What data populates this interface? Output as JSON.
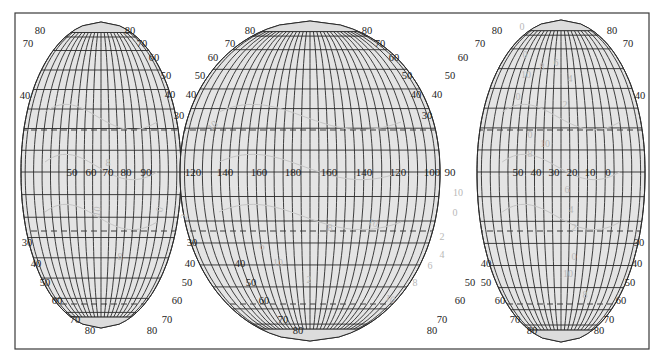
{
  "map": {
    "projection": "interrupted",
    "colors": {
      "background": "#ffffff",
      "frame": "#3a3a3a",
      "land_fill": "#e4e4e4",
      "polar_cap_fill": "#dcdcdc",
      "grid_line": "#2a2a2a",
      "dashed_line": "#3a3a3a",
      "contour_line": "#c4c4c4",
      "contour_label": "#b8b8b8",
      "label_text": "#222222"
    },
    "frame": {
      "x": 15,
      "y": 13,
      "width": 634,
      "height": 336
    },
    "equator_y": 172,
    "lobes": [
      {
        "name": "left-lobe",
        "center_x": 101,
        "half_width_at_equator": 80,
        "top_y": 22,
        "bottom_y": 328,
        "north_cut_x_left": 15,
        "north_cut_y": 82,
        "equator_labels": [
          "50",
          "60",
          "70",
          "80",
          "90"
        ],
        "equator_label_x": [
          72,
          91,
          108,
          126,
          146
        ],
        "lat_labels_left": [
          {
            "text": "80",
            "x": 40,
            "y": 34
          },
          {
            "text": "70",
            "x": 28,
            "y": 47
          },
          {
            "text": "40",
            "x": 25,
            "y": 99
          },
          {
            "text": "30",
            "x": 27,
            "y": 246
          },
          {
            "text": "40",
            "x": 36,
            "y": 267
          },
          {
            "text": "50",
            "x": 45,
            "y": 286
          },
          {
            "text": "60",
            "x": 57,
            "y": 304
          },
          {
            "text": "70",
            "x": 75,
            "y": 323
          },
          {
            "text": "80",
            "x": 90,
            "y": 334
          }
        ],
        "lat_labels_right": [
          {
            "text": "80",
            "x": 130,
            "y": 34
          },
          {
            "text": "70",
            "x": 142,
            "y": 47
          },
          {
            "text": "60",
            "x": 154,
            "y": 61
          },
          {
            "text": "50",
            "x": 166,
            "y": 79
          },
          {
            "text": "40",
            "x": 170,
            "y": 98
          },
          {
            "text": "30",
            "x": 179,
            "y": 119
          },
          {
            "text": "30",
            "x": 192,
            "y": 246
          },
          {
            "text": "40",
            "x": 190,
            "y": 267
          },
          {
            "text": "50",
            "x": 187,
            "y": 286
          },
          {
            "text": "60",
            "x": 177,
            "y": 304
          },
          {
            "text": "70",
            "x": 167,
            "y": 323
          },
          {
            "text": "80",
            "x": 152,
            "y": 334
          }
        ]
      },
      {
        "name": "center-lobe",
        "center_x": 310,
        "half_width_at_equator": 130,
        "top_y": 21,
        "bottom_y": 341,
        "equator_labels": [
          "120",
          "140",
          "160",
          "180",
          "160",
          "140",
          "120",
          "100"
        ],
        "equator_label_x": [
          193,
          225,
          259,
          293,
          329,
          364,
          398,
          432
        ],
        "lat_labels_left": [
          {
            "text": "80",
            "x": 250,
            "y": 34
          },
          {
            "text": "70",
            "x": 230,
            "y": 47
          },
          {
            "text": "60",
            "x": 213,
            "y": 61
          },
          {
            "text": "50",
            "x": 200,
            "y": 79
          },
          {
            "text": "40",
            "x": 191,
            "y": 98
          },
          {
            "text": "40",
            "x": 240,
            "y": 267
          },
          {
            "text": "50",
            "x": 251,
            "y": 286
          },
          {
            "text": "60",
            "x": 264,
            "y": 304
          },
          {
            "text": "70",
            "x": 283,
            "y": 323
          },
          {
            "text": "80",
            "x": 298,
            "y": 334
          }
        ],
        "lat_labels_right": [
          {
            "text": "80",
            "x": 367,
            "y": 34
          },
          {
            "text": "70",
            "x": 380,
            "y": 47
          },
          {
            "text": "60",
            "x": 394,
            "y": 61
          },
          {
            "text": "50",
            "x": 407,
            "y": 79
          },
          {
            "text": "40",
            "x": 416,
            "y": 98
          },
          {
            "text": "30",
            "x": 427,
            "y": 119
          },
          {
            "text": "40",
            "x": 486,
            "y": 267
          },
          {
            "text": "50",
            "x": 470,
            "y": 286
          },
          {
            "text": "60",
            "x": 460,
            "y": 304
          },
          {
            "text": "70",
            "x": 442,
            "y": 323
          },
          {
            "text": "80",
            "x": 432,
            "y": 334
          }
        ]
      },
      {
        "name": "right-lobe",
        "center_x": 561,
        "half_width_at_equator": 84,
        "top_y": 20,
        "bottom_y": 342,
        "north_cut_x_right": 649,
        "north_cut_y": 78,
        "equator_labels": [
          "50",
          "40",
          "30",
          "20",
          "10",
          "0"
        ],
        "equator_label_x": [
          518,
          536,
          554,
          572,
          590,
          608
        ],
        "extra_equator_labels": [
          {
            "text": "90",
            "x": 450
          }
        ],
        "lat_labels_left": [
          {
            "text": "80",
            "x": 497,
            "y": 34
          },
          {
            "text": "70",
            "x": 480,
            "y": 47
          },
          {
            "text": "60",
            "x": 463,
            "y": 61
          },
          {
            "text": "50",
            "x": 450,
            "y": 79
          },
          {
            "text": "40",
            "x": 437,
            "y": 98
          },
          {
            "text": "50",
            "x": 486,
            "y": 286
          },
          {
            "text": "60",
            "x": 500,
            "y": 304
          },
          {
            "text": "70",
            "x": 515,
            "y": 323
          },
          {
            "text": "80",
            "x": 532,
            "y": 334
          }
        ],
        "lat_labels_right": [
          {
            "text": "80",
            "x": 612,
            "y": 34
          },
          {
            "text": "70",
            "x": 628,
            "y": 47
          },
          {
            "text": "40",
            "x": 640,
            "y": 99
          },
          {
            "text": "30",
            "x": 639,
            "y": 246
          },
          {
            "text": "40",
            "x": 637,
            "y": 267
          },
          {
            "text": "50",
            "x": 630,
            "y": 286
          },
          {
            "text": "60",
            "x": 621,
            "y": 304
          },
          {
            "text": "70",
            "x": 609,
            "y": 323
          },
          {
            "text": "80",
            "x": 599,
            "y": 334
          }
        ]
      }
    ],
    "dashed_lines_y": [
      130,
      231,
      304
    ],
    "contour_labels": [
      {
        "text": "10",
        "x": 100,
        "y": 212,
        "rot": -80
      },
      {
        "text": "8",
        "x": 108,
        "y": 166,
        "rot": 0
      },
      {
        "text": "0",
        "x": 163,
        "y": 210,
        "rot": -80
      },
      {
        "text": "2",
        "x": 187,
        "y": 218,
        "rot": -70
      },
      {
        "text": "8",
        "x": 120,
        "y": 260,
        "rot": 0
      },
      {
        "text": "10",
        "x": 215,
        "y": 128,
        "rot": -45
      },
      {
        "text": "6",
        "x": 262,
        "y": 250,
        "rot": 0
      },
      {
        "text": "10",
        "x": 278,
        "y": 266,
        "rot": 0
      },
      {
        "text": "2",
        "x": 309,
        "y": 283,
        "rot": 0
      },
      {
        "text": "8",
        "x": 330,
        "y": 231,
        "rot": 0
      },
      {
        "text": "10",
        "x": 372,
        "y": 226,
        "rot": 20
      },
      {
        "text": "10",
        "x": 389,
        "y": 302,
        "rot": 20
      },
      {
        "text": "8",
        "x": 415,
        "y": 286,
        "rot": 0
      },
      {
        "text": "6",
        "x": 430,
        "y": 269,
        "rot": 0
      },
      {
        "text": "4",
        "x": 442,
        "y": 258,
        "rot": 0
      },
      {
        "text": "2",
        "x": 442,
        "y": 240,
        "rot": 0
      },
      {
        "text": "10",
        "x": 458,
        "y": 196,
        "rot": 0
      },
      {
        "text": "0",
        "x": 455,
        "y": 216,
        "rot": 0
      },
      {
        "text": "0",
        "x": 522,
        "y": 30,
        "rot": 0
      },
      {
        "text": "0",
        "x": 525,
        "y": 58,
        "rot": 0
      },
      {
        "text": "8",
        "x": 542,
        "y": 70,
        "rot": 0
      },
      {
        "text": "6",
        "x": 556,
        "y": 66,
        "rot": 0
      },
      {
        "text": "10",
        "x": 526,
        "y": 78,
        "rot": 0
      },
      {
        "text": "4",
        "x": 570,
        "y": 82,
        "rot": 0
      },
      {
        "text": "0",
        "x": 518,
        "y": 100,
        "rot": 0
      },
      {
        "text": "2",
        "x": 565,
        "y": 108,
        "rot": 0
      },
      {
        "text": "0",
        "x": 530,
        "y": 138,
        "rot": 0
      },
      {
        "text": "10",
        "x": 545,
        "y": 147,
        "rot": 0
      },
      {
        "text": "8",
        "x": 530,
        "y": 157,
        "rot": 0
      },
      {
        "text": "6",
        "x": 567,
        "y": 193,
        "rot": 0
      },
      {
        "text": "4",
        "x": 571,
        "y": 213,
        "rot": 0
      },
      {
        "text": "2",
        "x": 574,
        "y": 231,
        "rot": 0
      },
      {
        "text": "0",
        "x": 574,
        "y": 260,
        "rot": 0
      },
      {
        "text": "10",
        "x": 568,
        "y": 277,
        "rot": 0
      },
      {
        "text": "8",
        "x": 585,
        "y": 298,
        "rot": 0
      }
    ]
  }
}
